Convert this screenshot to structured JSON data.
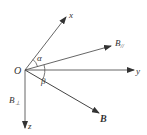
{
  "diagram": {
    "origin_label": "O",
    "axes": {
      "x": "x",
      "y": "y",
      "z": "z"
    },
    "vectors": {
      "B": "B",
      "B_parallel": "B",
      "B_parallel_sub": "//",
      "B_perp": "B",
      "B_perp_sub": "⊥"
    },
    "angles": {
      "alpha": "α",
      "beta": "β"
    },
    "colors": {
      "line": "#444444",
      "text": "#333333"
    }
  }
}
